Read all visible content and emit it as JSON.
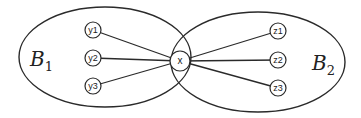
{
  "diagram": {
    "type": "set-graph",
    "sets": [
      {
        "id": "B1",
        "label": "B",
        "subscript": "1",
        "ellipse": {
          "cx": 105,
          "cy": 57,
          "rx": 86,
          "ry": 50
        }
      },
      {
        "id": "B2",
        "label": "B",
        "subscript": "2",
        "ellipse": {
          "cx": 258,
          "cy": 62,
          "rx": 87,
          "ry": 50
        }
      }
    ],
    "center_node": {
      "id": "x",
      "label": "x",
      "cx": 180,
      "cy": 61,
      "r": 10
    },
    "nodes": [
      {
        "id": "y1",
        "label": "y1",
        "cx": 93,
        "cy": 30,
        "r": 8,
        "set": "B1"
      },
      {
        "id": "y2",
        "label": "y2",
        "cx": 93,
        "cy": 58,
        "r": 8,
        "set": "B1"
      },
      {
        "id": "y3",
        "label": "y3",
        "cx": 93,
        "cy": 86,
        "r": 8,
        "set": "B1"
      },
      {
        "id": "z1",
        "label": "z1",
        "cx": 278,
        "cy": 31,
        "r": 8,
        "set": "B2"
      },
      {
        "id": "z2",
        "label": "z2",
        "cx": 278,
        "cy": 60,
        "r": 8,
        "set": "B2"
      },
      {
        "id": "z3",
        "label": "z3",
        "cx": 278,
        "cy": 88,
        "r": 8,
        "set": "B2"
      }
    ],
    "edges": [
      [
        "x",
        "y1"
      ],
      [
        "x",
        "y2"
      ],
      [
        "x",
        "y3"
      ],
      [
        "x",
        "z1"
      ],
      [
        "x",
        "z2"
      ],
      [
        "x",
        "z3"
      ]
    ],
    "colors": {
      "stroke": "#2a2a2a",
      "background": "#ffffff"
    }
  }
}
